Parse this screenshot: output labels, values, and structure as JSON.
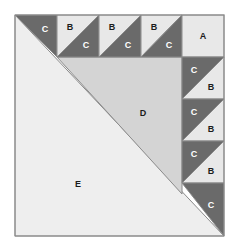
{
  "diagram": {
    "type": "quilt-block-piecing-diagram",
    "title": "",
    "colors": {
      "background": "#ffffff",
      "dark_gray": "#6a6a6a",
      "light_gray": "#e8e8e8",
      "pale_gray": "#eeeeee",
      "mid_gray": "#d4d4d4",
      "outline": "#8a8a8a",
      "label_on_dark": "#ffffff",
      "label_on_light": "#1c1c1c"
    },
    "geometry": {
      "block_x": 15,
      "block_y": 15,
      "block_width": 209,
      "block_height": 221,
      "cell_size": 42,
      "top_row_cells": 5,
      "right_col_cells": 5
    },
    "labels": {
      "a": "A",
      "b": "B",
      "c": "C",
      "d": "D",
      "e": "E"
    },
    "pieces": {
      "top_row": [
        {
          "name": "top-cell-1",
          "dark_label": "C",
          "light_label": ""
        },
        {
          "name": "top-cell-2",
          "dark_label": "C",
          "light_label": "B"
        },
        {
          "name": "top-cell-3",
          "dark_label": "C",
          "light_label": "B"
        },
        {
          "name": "top-cell-4",
          "dark_label": "C",
          "light_label": "B"
        },
        {
          "name": "top-cell-5",
          "dark_label": "",
          "light_label": "A"
        }
      ],
      "right_column": [
        {
          "name": "right-cell-1",
          "dark_label": "",
          "light_label": "A"
        },
        {
          "name": "right-cell-2",
          "dark_label": "C",
          "light_label": "B"
        },
        {
          "name": "right-cell-3",
          "dark_label": "C",
          "light_label": "B"
        },
        {
          "name": "right-cell-4",
          "dark_label": "C",
          "light_label": "B"
        },
        {
          "name": "right-cell-5",
          "dark_label": "C",
          "light_label": ""
        }
      ],
      "center": [
        {
          "name": "center-triangle-d",
          "label": "D"
        },
        {
          "name": "center-triangle-e",
          "label": "E"
        }
      ]
    }
  }
}
